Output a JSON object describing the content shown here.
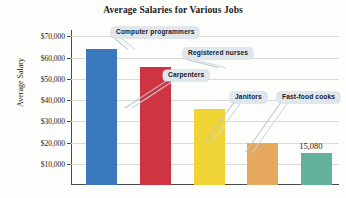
{
  "chart_data": {
    "type": "bar",
    "title": "Average Salaries for Various Jobs",
    "xlabel": "",
    "ylabel": "Average Salary",
    "ylim": [
      0,
      70000
    ],
    "grid": true,
    "legend": "none",
    "categories": [
      "Computer programmers",
      "Registered nurses",
      "Carpenters",
      "Janitors",
      "Fast-food cooks"
    ],
    "values": [
      64000,
      55500,
      36000,
      19800,
      15080
    ],
    "tick_labels": [
      "$70,000",
      "$60,000",
      "$50,000",
      "$40,000",
      "$30,000",
      "$20,000",
      "$10,000"
    ],
    "tick_values": [
      70000,
      60000,
      50000,
      40000,
      30000,
      20000,
      10000
    ],
    "colors": [
      "#3a79bd",
      "#cf3541",
      "#f0d435",
      "#e6a85c",
      "#63b09c"
    ],
    "annotations": [
      {
        "text": "15,080",
        "series_index": 4,
        "kind": "data-label"
      }
    ]
  },
  "callouts": [
    {
      "label": "Computer programmers"
    },
    {
      "label": "Registered nurses"
    },
    {
      "label": "Carpenters"
    },
    {
      "label": "Janitors"
    },
    {
      "label": "Fast-food cooks"
    }
  ]
}
